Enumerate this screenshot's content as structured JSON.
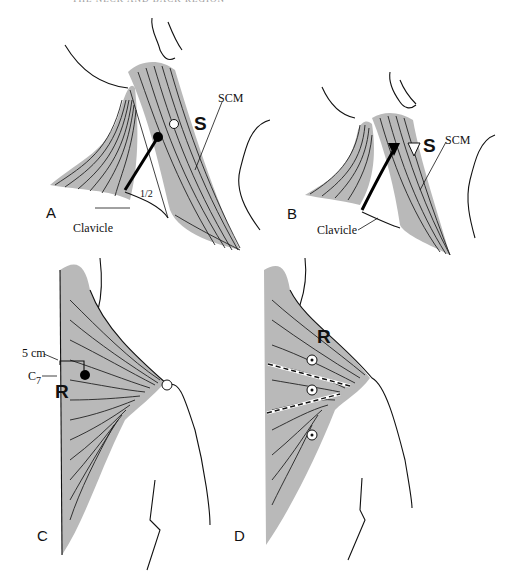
{
  "header_text": "THE NECK AND BACK REGION",
  "panels": {
    "A": {
      "label": "A",
      "muscle_label": "S",
      "scm_label": "SCM",
      "clavicle_label": "Clavicle",
      "fraction_label": "1/2"
    },
    "B": {
      "label": "B",
      "muscle_label": "S",
      "scm_label": "SCM",
      "clavicle_label": "Clavicle"
    },
    "C": {
      "label": "C",
      "muscle_label": "R",
      "distance_label": "5 cm",
      "vertebra_label": "C",
      "vertebra_sub": "7"
    },
    "D": {
      "label": "D",
      "muscle_label": "R"
    }
  }
}
